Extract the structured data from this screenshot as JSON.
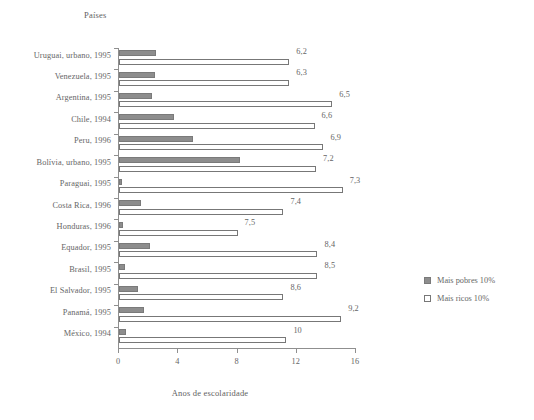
{
  "chart_data": {
    "type": "bar",
    "orientation": "horizontal",
    "title": "",
    "xlabel": "Anos de escolaridade",
    "ylabel": "Países",
    "xlim": [
      0,
      16
    ],
    "xticks": [
      "0",
      "4",
      "8",
      "12",
      "16"
    ],
    "xtick_values": [
      0,
      4,
      8,
      12,
      16
    ],
    "grid": false,
    "legend_position": "right",
    "categories": [
      "Uruguai, urbano, 1995",
      "Venezuela, 1995",
      "Argentina, 1995",
      "Chile, 1994",
      "Peru, 1996",
      "Bolívia, urbano, 1995",
      "Paraguai, 1995",
      "Costa Rica, 1996",
      "Honduras, 1996",
      "Equador, 1995",
      "Brasil, 1995",
      "El Salvador, 1995",
      "Panamá, 1995",
      "México, 1994"
    ],
    "series": [
      {
        "name": "Mais pobres 10%",
        "color": "#8d8d8d",
        "values": [
          2.5,
          2.4,
          2.2,
          3.7,
          5.0,
          8.2,
          0.2,
          1.5,
          0.3,
          2.1,
          0.4,
          1.3,
          1.7,
          0.5
        ]
      },
      {
        "name": "Mais ricos 10%",
        "color": "#ffffff",
        "values": [
          11.5,
          11.5,
          14.4,
          13.2,
          13.8,
          13.3,
          15.1,
          11.1,
          8.0,
          13.4,
          13.4,
          11.1,
          15.0,
          11.3
        ]
      }
    ],
    "annotations": [
      "6,2",
      "6,3",
      "6,5",
      "6,6",
      "6,9",
      "7,2",
      "7,3",
      "7,4",
      "7,5",
      "8,4",
      "8,5",
      "8,6",
      "9,2",
      "10"
    ],
    "annotation_meaning": "razao entre mais ricos e mais pobres"
  },
  "legend": {
    "items": [
      {
        "label": "Mais pobres 10%",
        "swatch": "filled-gray-swatch"
      },
      {
        "label": "Mais ricos 10%",
        "swatch": "outlined-white-swatch"
      }
    ]
  }
}
